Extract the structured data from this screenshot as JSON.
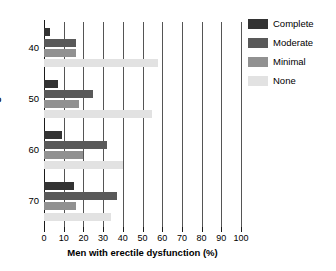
{
  "chart_data": {
    "type": "bar",
    "orientation": "horizontal",
    "title": "",
    "xlabel": "Men with erectile dysfunction (%)",
    "ylabel": "Age",
    "categories": [
      "40",
      "50",
      "60",
      "70"
    ],
    "xlim": [
      0,
      100
    ],
    "xticks": [
      0,
      10,
      20,
      30,
      40,
      50,
      60,
      70,
      80,
      90,
      100
    ],
    "grid": "vertical",
    "legend_position": "top-right",
    "series": [
      {
        "name": "Complete",
        "color": "#333333",
        "values": [
          3,
          7,
          9,
          15
        ]
      },
      {
        "name": "Moderate",
        "color": "#595959",
        "values": [
          16,
          25,
          32,
          37
        ]
      },
      {
        "name": "Minimal",
        "color": "#919191",
        "values": [
          16,
          18,
          20,
          16
        ]
      },
      {
        "name": "None",
        "color": "#e2e2e2",
        "values": [
          58,
          55,
          40,
          34
        ]
      }
    ]
  },
  "legend": {
    "items": [
      {
        "label": "Complete"
      },
      {
        "label": "Moderate"
      },
      {
        "label": "Minimal"
      },
      {
        "label": "None"
      }
    ]
  },
  "axes": {
    "x_title": "Men with erectile dysfunction (%)",
    "y_title": "Age",
    "x_tick_labels": [
      "0",
      "10",
      "20",
      "30",
      "40",
      "50",
      "60",
      "70",
      "80",
      "90",
      "100"
    ],
    "y_tick_labels": [
      "40",
      "50",
      "60",
      "70"
    ]
  }
}
